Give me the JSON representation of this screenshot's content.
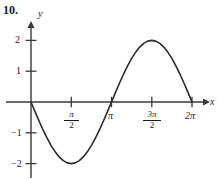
{
  "figure": {
    "problem_number": "10.",
    "axis_x_label": "x",
    "axis_y_label": "y",
    "y_ticks": [
      {
        "label": "2",
        "value": 2
      },
      {
        "label": "1",
        "value": 1
      },
      {
        "label": "−1",
        "value": -1
      },
      {
        "label": "−2",
        "value": -2
      }
    ],
    "x_ticks": [
      {
        "label": "π/2",
        "numerator": "π",
        "denominator": "2",
        "value": 1.5708,
        "fraction": true
      },
      {
        "label": "π",
        "numerator": "π",
        "denominator": "",
        "value": 3.1416,
        "fraction": false
      },
      {
        "label": "3π/2",
        "numerator": "3π",
        "denominator": "2",
        "value": 4.7124,
        "fraction": true
      },
      {
        "label": "2π",
        "numerator": "2π",
        "denominator": "",
        "value": 6.2832,
        "fraction": false
      }
    ],
    "curve_color": "#2b2b2b",
    "axis_color": "#3a3a3a",
    "background_color": "#ffffff"
  },
  "chart_data": {
    "type": "line",
    "title": "",
    "subtitle": "",
    "xlabel": "x",
    "ylabel": "y",
    "xlim": [
      -0.25,
      6.9
    ],
    "ylim": [
      -2.45,
      2.45
    ],
    "grid": false,
    "legend": null,
    "equation": "y = -2 sin(x)",
    "xtick_values": [
      1.5708,
      3.1416,
      4.7124,
      6.2832
    ],
    "xtick_labels": [
      "π/2",
      "π",
      "3π/2",
      "2π"
    ],
    "ytick_values": [
      2,
      1,
      -1,
      -2
    ],
    "ytick_labels": [
      "2",
      "1",
      "−1",
      "−2"
    ],
    "annotations": [
      {
        "text": "minimum",
        "x": 1.5708,
        "y": -2
      },
      {
        "text": "maximum",
        "x": 4.7124,
        "y": 2
      },
      {
        "text": "zero",
        "x": 0,
        "y": 0
      },
      {
        "text": "zero",
        "x": 3.1416,
        "y": 0
      },
      {
        "text": "zero",
        "x": 6.2832,
        "y": 0
      }
    ],
    "series": [
      {
        "name": "y = -2 sin(x)",
        "x": [
          0.0,
          0.1571,
          0.3142,
          0.4712,
          0.6283,
          0.7854,
          0.9425,
          1.0996,
          1.2566,
          1.4137,
          1.5708,
          1.7279,
          1.885,
          2.042,
          2.1991,
          2.3562,
          2.5133,
          2.6704,
          2.8274,
          2.9845,
          3.1416,
          3.2987,
          3.4558,
          3.6128,
          3.7699,
          3.927,
          4.0841,
          4.2412,
          4.3982,
          4.5553,
          4.7124,
          4.8695,
          5.0265,
          5.1836,
          5.3407,
          5.4978,
          5.6549,
          5.8119,
          5.969,
          6.1261,
          6.2832
        ],
        "y": [
          0.0,
          -0.3129,
          -0.618,
          -0.908,
          -1.1756,
          -1.4142,
          -1.618,
          -1.782,
          -1.9021,
          -1.9754,
          -2.0,
          -1.9754,
          -1.9021,
          -1.782,
          -1.618,
          -1.4142,
          -1.1756,
          -0.908,
          -0.618,
          -0.3129,
          0.0,
          0.3129,
          0.618,
          0.908,
          1.1756,
          1.4142,
          1.618,
          1.782,
          1.9021,
          1.9754,
          2.0,
          1.9754,
          1.9021,
          1.782,
          1.618,
          1.4142,
          1.1756,
          0.908,
          0.618,
          0.3129,
          0.0
        ]
      }
    ]
  }
}
